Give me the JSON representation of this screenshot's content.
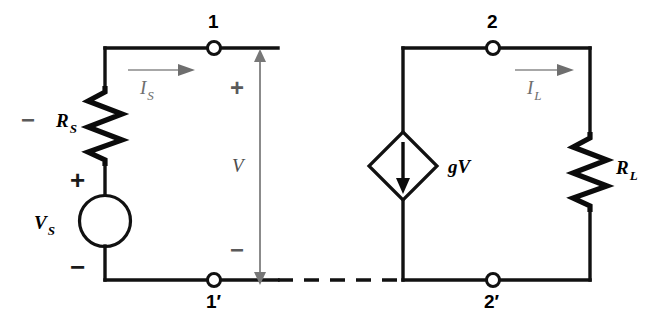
{
  "figure": {
    "kind": "circuit-schematic",
    "background_color": "#ffffff",
    "line_color": "#111111",
    "annotation_color": "#777777"
  },
  "left_network": {
    "resistor_label": "R",
    "resistor_sub": "S",
    "source_label": "V",
    "source_sub": "S",
    "source_plus": "+",
    "source_minus": "−",
    "resistor_minus": "−",
    "current_label": "I",
    "current_sub": "S"
  },
  "port_left": {
    "node_top": "1",
    "node_bottom": "1′",
    "voltage_label": "V",
    "voltage_plus": "+",
    "voltage_minus": "−"
  },
  "right_network": {
    "source_label": "gV",
    "resistor_label": "R",
    "resistor_sub": "L",
    "current_label": "I",
    "current_sub": "L"
  },
  "port_right": {
    "node_top": "2",
    "node_bottom": "2′"
  }
}
